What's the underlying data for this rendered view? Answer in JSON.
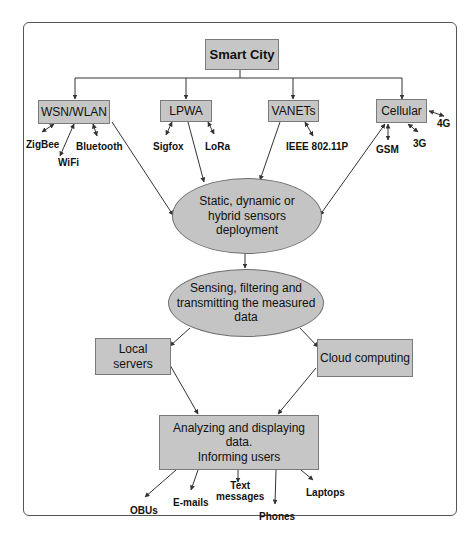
{
  "diagram": {
    "root": {
      "label": "Smart City"
    },
    "networks": [
      {
        "label": "WSN/WLAN",
        "technologies": [
          "ZigBee",
          "WiFi",
          "Bluetooth"
        ]
      },
      {
        "label": "LPWA",
        "technologies": [
          "Sigfox",
          "LoRa"
        ]
      },
      {
        "label": "VANETs",
        "technologies": [
          "IEEE 802.11P"
        ]
      },
      {
        "label": "Cellular",
        "technologies": [
          "4G",
          "3G",
          "GSM"
        ]
      }
    ],
    "deployment": {
      "label": "Static, dynamic or hybrid sensors deployment",
      "lines": [
        "Static, dynamic or",
        "hybrid sensors",
        "deployment"
      ]
    },
    "sensing": {
      "label": "Sensing, filtering and transmitting the measured data",
      "lines": [
        "Sensing, filtering and",
        "transmitting the measured",
        "data"
      ]
    },
    "processing": [
      {
        "label": "Local servers",
        "lines": [
          "Local",
          "servers"
        ]
      },
      {
        "label": "Cloud computing"
      }
    ],
    "output": {
      "label": "Analyzing and displaying data. Informing users",
      "lines": [
        "Analyzing and displaying data.",
        "Informing users"
      ]
    },
    "endpoints": [
      "OBUs",
      "E-mails",
      "Text messages",
      "Phones",
      "Laptops"
    ],
    "endpoint_text_lines": [
      "Text",
      "messages"
    ],
    "colors": {
      "box_fill": "#c6c6c6",
      "box_border": "#7a7a7a",
      "line": "#333333",
      "frame": "#555555"
    }
  }
}
